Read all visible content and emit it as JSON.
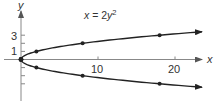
{
  "chart_data": {
    "type": "line",
    "title": "",
    "annotation": "x = 2y²",
    "equation": {
      "lhs": "x",
      "eq": " = 2",
      "var": "y",
      "exp": "2"
    },
    "xlabel": "x",
    "ylabel": "y",
    "xlim": [
      0,
      24
    ],
    "ylim": [
      -4.5,
      5
    ],
    "x_ticks": [
      10,
      20
    ],
    "x_tick_labels": [
      "10",
      "20"
    ],
    "y_ticks": [
      -3,
      -2,
      -1,
      1,
      2,
      3
    ],
    "y_tick_labels": {
      "3": "3",
      "1": "1"
    },
    "grid": false,
    "legend": null,
    "series": [
      {
        "name": "upper branch (y ≥ 0)",
        "points": [
          {
            "x": 0,
            "y": 0
          },
          {
            "x": 2,
            "y": 1
          },
          {
            "x": 8,
            "y": 2
          },
          {
            "x": 18,
            "y": 3
          }
        ],
        "continues_with_arrow": true
      },
      {
        "name": "lower branch (y ≤ 0)",
        "points": [
          {
            "x": 0,
            "y": 0
          },
          {
            "x": 2,
            "y": -1
          },
          {
            "x": 8,
            "y": -2
          },
          {
            "x": 18,
            "y": -3
          }
        ],
        "continues_with_arrow": true
      }
    ],
    "colors": {
      "axis": "#888888",
      "curve": "#222222",
      "text": "#333333"
    }
  }
}
